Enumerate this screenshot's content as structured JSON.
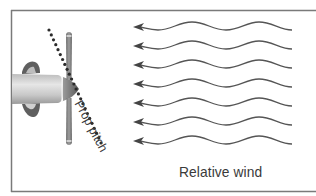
{
  "diagram": {
    "labels": {
      "relative_wind": "Relative wind",
      "prop_pitch": "Prop pitch"
    },
    "wind_arrow_count": 7,
    "colors": {
      "frame": "#7a7a7a",
      "wind_line": "#555555",
      "dotted_line": "#2b2b2b",
      "text": "#3a3a3a",
      "blade": "#8a8a8a",
      "cowling_dark": "#5f5f5f",
      "body_light": "#d8d8d8",
      "spinner": "#777777"
    }
  }
}
